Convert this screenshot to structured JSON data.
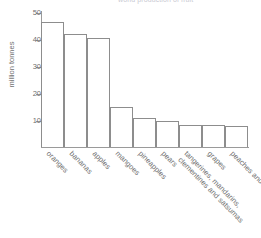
{
  "chart_data": {
    "type": "bar",
    "title": "world production of fruit",
    "xlabel": "",
    "ylabel": "million tonnes",
    "ylim": [
      0,
      50
    ],
    "yticks": [
      10,
      20,
      30,
      40,
      50
    ],
    "grid": false,
    "legend": null,
    "categories": [
      "oranges",
      "bananas",
      "apples",
      "mangoes",
      "pineapples",
      "pears",
      "tangerines, mandarins, clementines and satsumas",
      "grapes",
      "peaches and nectarines"
    ],
    "category_lines": [
      [
        "oranges"
      ],
      [
        "bananas"
      ],
      [
        "apples"
      ],
      [
        "mangoes"
      ],
      [
        "pineapples"
      ],
      [
        "pears"
      ],
      [
        "tangerines, mandarins,",
        "clementines and satsumas"
      ],
      [
        "grapes"
      ],
      [
        "peaches and nectarines"
      ]
    ],
    "values": [
      46.7,
      42.0,
      40.7,
      15.0,
      10.7,
      9.6,
      8.3,
      8.2,
      7.7
    ],
    "bar_fill": "#ffffff",
    "bar_stroke": "#8d8d8d",
    "axis_color": "#9a9a9a",
    "text_color": "#6f6f6f"
  },
  "axis": {
    "y_title": "million tonnes",
    "tick_labels": [
      "50",
      "40",
      "30",
      "20",
      "10"
    ]
  }
}
